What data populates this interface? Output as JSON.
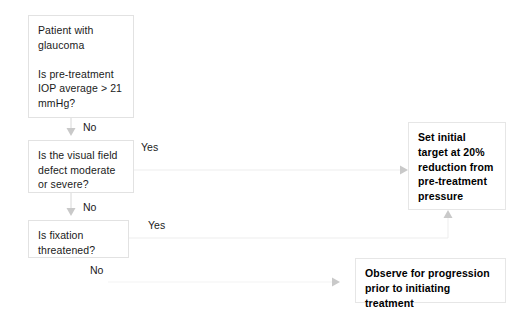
{
  "diagram": {
    "background_color": "#ffffff",
    "border_color": "#e2e2e2",
    "text_color": "#1a1a1a",
    "nodes": [
      {
        "id": "start",
        "name": "patient-glaucoma-question",
        "text": "Patient with glaucoma\n\nIs pre-treatment IOP  average > 21 mmHg?",
        "bold": false
      },
      {
        "id": "visual-field",
        "name": "visual-field-defect-question",
        "text": "Is the visual field defect moderate or severe?",
        "bold": false
      },
      {
        "id": "fixation",
        "name": "fixation-threatened-question",
        "text": "Is fixation threatened?",
        "bold": false
      },
      {
        "id": "set-target",
        "name": "set-initial-target-action",
        "text": "Set initial target at 20% reduction from pre-treatment pressure",
        "bold": true
      },
      {
        "id": "observe",
        "name": "observe-progression-action",
        "text": "Observe for progression prior to initiating treatment",
        "bold": true
      }
    ],
    "edges": [
      {
        "id": "e1",
        "from": "start",
        "to": "visual-field",
        "label": "No"
      },
      {
        "id": "e2",
        "from": "visual-field",
        "to": "set-target",
        "label": "Yes"
      },
      {
        "id": "e3",
        "from": "visual-field",
        "to": "fixation",
        "label": "No"
      },
      {
        "id": "e4",
        "from": "fixation",
        "to": "set-target",
        "label": "Yes"
      },
      {
        "id": "e5",
        "from": "fixation",
        "to": "observe",
        "label": "No"
      }
    ]
  }
}
